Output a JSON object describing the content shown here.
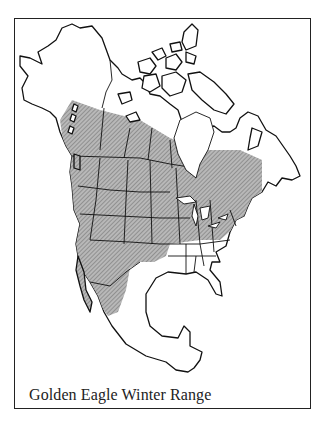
{
  "map": {
    "title": "Golden Eagle Winter Range",
    "subject": "Golden Eagle",
    "layer": "Winter Range",
    "region": "North America",
    "colors": {
      "range_fill": "#9a9a9a",
      "outline": "#111111",
      "background": "#ffffff"
    },
    "legend": []
  }
}
